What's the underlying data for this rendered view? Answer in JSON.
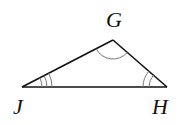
{
  "diagram": {
    "type": "triangle",
    "vertices": [
      {
        "id": "J",
        "label": "J",
        "angle_marks": 3
      },
      {
        "id": "H",
        "label": "H",
        "angle_marks": 2
      },
      {
        "id": "G",
        "label": "G",
        "angle_marks": 1
      }
    ],
    "sides": [
      "JG",
      "GH",
      "JH"
    ],
    "colors": {
      "line": "#111111",
      "arc": "#777777",
      "label": "#111111",
      "background": "#ffffff"
    }
  },
  "labels": {
    "g": "G",
    "j": "J",
    "h": "H"
  }
}
